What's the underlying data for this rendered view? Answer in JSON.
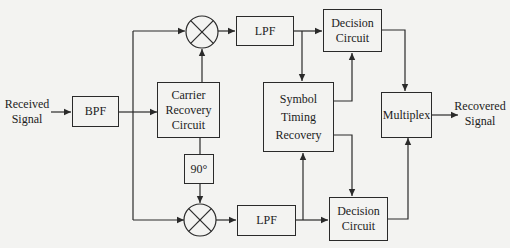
{
  "diagram": {
    "type": "block-diagram",
    "title": "",
    "input_label": [
      "Received",
      "Signal"
    ],
    "output_label": [
      "Recovered",
      "Signal"
    ],
    "blocks": {
      "bpf": [
        "BPF"
      ],
      "carrier_recovery": [
        "Carrier",
        "Recovery",
        "Circuit"
      ],
      "phase_shift": [
        "90°"
      ],
      "lpf_top": [
        "LPF"
      ],
      "lpf_bottom": [
        "LPF"
      ],
      "decision_top": [
        "Decision",
        "Circuit"
      ],
      "decision_bottom": [
        "Decision",
        "Circuit"
      ],
      "symbol_timing": [
        "Symbol",
        "Timing",
        "Recovery"
      ],
      "multiplex": [
        "Multiplex"
      ]
    },
    "mixers": [
      "mixer-top",
      "mixer-bottom"
    ],
    "connections": [
      [
        "Received Signal",
        "BPF"
      ],
      [
        "BPF",
        "Carrier Recovery Circuit"
      ],
      [
        "BPF",
        "mixer-top"
      ],
      [
        "BPF",
        "mixer-bottom"
      ],
      [
        "Carrier Recovery Circuit",
        "mixer-top"
      ],
      [
        "Carrier Recovery Circuit",
        "90°"
      ],
      [
        "90°",
        "mixer-bottom"
      ],
      [
        "mixer-top",
        "LPF (top)"
      ],
      [
        "mixer-bottom",
        "LPF (bottom)"
      ],
      [
        "LPF (top)",
        "Decision Circuit (top)"
      ],
      [
        "LPF (top)",
        "Symbol Timing Recovery"
      ],
      [
        "LPF (bottom)",
        "Decision Circuit (bottom)"
      ],
      [
        "LPF (bottom)",
        "Symbol Timing Recovery"
      ],
      [
        "Symbol Timing Recovery",
        "Decision Circuit (top)"
      ],
      [
        "Symbol Timing Recovery",
        "Decision Circuit (bottom)"
      ],
      [
        "Decision Circuit (top)",
        "Multiplex"
      ],
      [
        "Decision Circuit (bottom)",
        "Multiplex"
      ],
      [
        "Multiplex",
        "Recovered Signal"
      ]
    ],
    "colors": {
      "stroke": "#2a2a2a",
      "background": "#f3f3f1",
      "text": "#1c1c1c"
    }
  }
}
